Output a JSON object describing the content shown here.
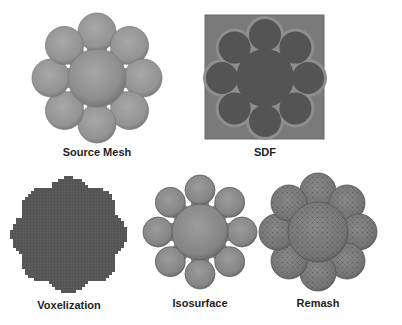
{
  "figure": {
    "panels": [
      {
        "id": "source-mesh",
        "label": "Source Mesh",
        "style": "smooth-shaded"
      },
      {
        "id": "sdf",
        "label": "SDF",
        "style": "distance-field"
      },
      {
        "id": "voxelization",
        "label": "Voxelization",
        "style": "voxel-grid"
      },
      {
        "id": "isosurface",
        "label": "Isosurface",
        "style": "smooth-shaded"
      },
      {
        "id": "remash",
        "label": "Remash",
        "style": "triangulated"
      }
    ],
    "shape": {
      "name": "eight-petal flower",
      "petal_count": 8
    },
    "colors": {
      "mesh_light": "#a3a3a3",
      "mesh_mid": "#8c8c8c",
      "mesh_dark": "#6e6e6e",
      "sdf_background": "#7a7a7a",
      "sdf_inner": "#545454",
      "sdf_band": "#8e8e8e",
      "voxel": "#5a5a5a",
      "remesh": "#7c7c7c",
      "label_text": "#1e1e1e"
    }
  }
}
